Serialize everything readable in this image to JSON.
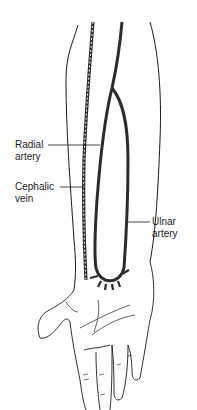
{
  "figure": {
    "labels": {
      "radial_artery": [
        "Radial",
        "artery"
      ],
      "cephalic_vein": [
        "Cephalic",
        "vein"
      ],
      "ulnar_artery": [
        "Ulnar",
        "artery"
      ]
    },
    "colors": {
      "ink": "#1a1a1a",
      "vessel": "#2b2b2b",
      "background": "#ffffff"
    }
  }
}
